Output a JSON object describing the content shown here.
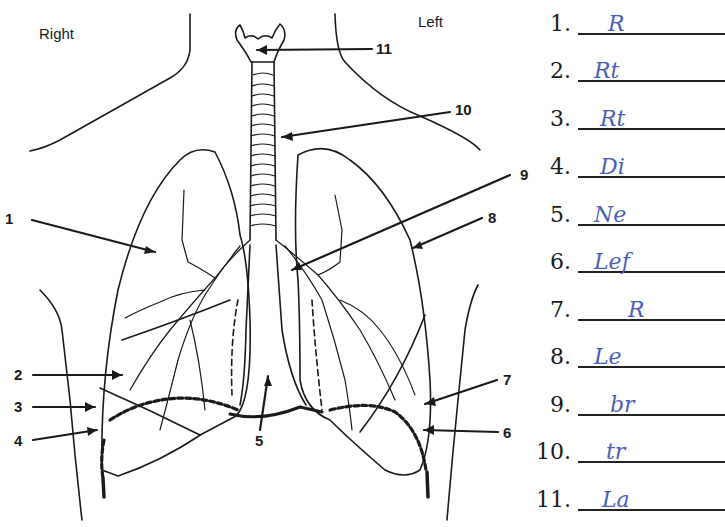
{
  "diagram": {
    "side_labels": {
      "right": "Right",
      "left": "Left"
    },
    "callouts": [
      {
        "id": 1,
        "label": "1"
      },
      {
        "id": 2,
        "label": "2"
      },
      {
        "id": 3,
        "label": "3"
      },
      {
        "id": 4,
        "label": "4"
      },
      {
        "id": 5,
        "label": "5"
      },
      {
        "id": 6,
        "label": "6"
      },
      {
        "id": 7,
        "label": "7"
      },
      {
        "id": 8,
        "label": "8"
      },
      {
        "id": 9,
        "label": "9"
      },
      {
        "id": 10,
        "label": "10"
      },
      {
        "id": 11,
        "label": "11"
      }
    ],
    "colors": {
      "ink": "#1a1a1a",
      "handwriting": "#4a5fb5"
    }
  },
  "answers": [
    {
      "num": "1.",
      "text": "R"
    },
    {
      "num": "2.",
      "text": "Rt"
    },
    {
      "num": "3.",
      "text": "Rt"
    },
    {
      "num": "4.",
      "text": "Di"
    },
    {
      "num": "5.",
      "text": "Ne"
    },
    {
      "num": "6.",
      "text": "Lef"
    },
    {
      "num": "7.",
      "text": "R"
    },
    {
      "num": "8.",
      "text": "Le"
    },
    {
      "num": "9.",
      "text": "br"
    },
    {
      "num": "10.",
      "text": "tr"
    },
    {
      "num": "11.",
      "text": "La"
    }
  ]
}
